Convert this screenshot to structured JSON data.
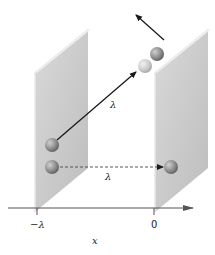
{
  "diagram": {
    "labels": {
      "diagonal_path": "λ",
      "horizontal_path": "λ",
      "tick_left": "−λ",
      "tick_right": "0",
      "axis": "x"
    },
    "colors": {
      "plate_face": "#c9c9c9",
      "plate_edge": "#e6e6e6",
      "ball_dark": "#8e8e8e",
      "ball_light": "#cfcfcf",
      "arrow": "#1a1a1a",
      "axis": "#333333"
    }
  }
}
